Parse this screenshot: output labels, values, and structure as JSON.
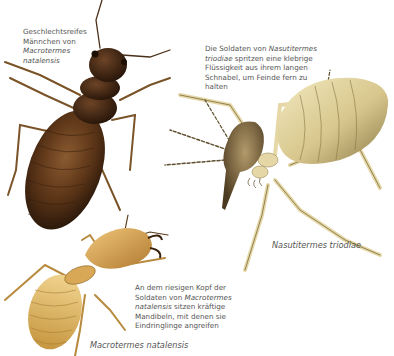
{
  "illustrations": [
    {
      "id": "macrotermes-male",
      "caption_lines": [
        "Geschlechtsreifes",
        "Männchen von",
        "Macrotermes",
        "natalensis"
      ],
      "caption_italic_lines": [
        2,
        3
      ],
      "body_color": "#5a3417"
    },
    {
      "id": "nasutitermes-soldier",
      "caption_lines": [
        "Die Soldaten von Nasutitermes",
        "triodiae spritzen eine klebrige",
        "Flüssigkeit aus ihrem langen",
        "Schnabel, um Feinde fern zu",
        "halten"
      ],
      "label": "Nasutitermes triodiae",
      "body_color": "#e8dca8"
    },
    {
      "id": "macrotermes-soldier",
      "caption_lines": [
        "An dem riesigen Kopf der",
        "Soldaten von Macrotermes",
        "natalensis sitzen kräftige",
        "Mandibeln, mit denen sie",
        "Eindringlinge angreifen"
      ],
      "label": "Macrotermes natalensis",
      "body_color": "#d9a856"
    }
  ],
  "captions": {
    "male": {
      "l1": "Geschlechtsreifes",
      "l2": "Männchen von",
      "l3": "Macrotermes",
      "l4": "natalensis"
    },
    "nasuti": {
      "l1a": "Die Soldaten von ",
      "l1b": "Nasutitermes",
      "l2a": "triodiae",
      "l2b": " spritzen eine klebrige",
      "l3": "Flüssigkeit aus ihrem langen",
      "l4": "Schnabel, um Feinde fern zu",
      "l5": "halten"
    },
    "soldier": {
      "l1": "An dem riesigen Kopf der",
      "l2a": "Soldaten von ",
      "l2b": "Macrotermes",
      "l3a": "natalensis",
      "l3b": " sitzen kräftige",
      "l4": "Mandibeln, mit denen sie",
      "l5": "Eindringlinge angreifen"
    }
  },
  "labels": {
    "nasuti": "Nasutitermes triodiae",
    "macro": "Macrotermes natalensis"
  }
}
